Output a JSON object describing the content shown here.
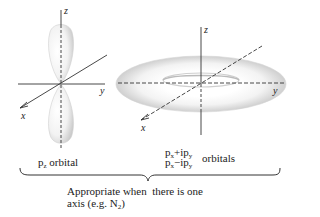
{
  "left_panel": {
    "axes": {
      "z": "z",
      "y": "y",
      "x": "x"
    },
    "label": {
      "main": "p",
      "sub": "z",
      "suffix": " orbital"
    }
  },
  "right_panel": {
    "axes": {
      "z": "z",
      "y": "y",
      "x": "x"
    },
    "label_line1": {
      "p1": "p",
      "s1": "x",
      "op": "+ip",
      "s2": "y"
    },
    "label_line2": {
      "p1": "p",
      "s1": "x",
      "op": "−ip",
      "s2": "y"
    },
    "label_suffix": "orbitals"
  },
  "caption": {
    "line1": "Appropriate when  there is one",
    "line2_main": "axis (e.g. N",
    "line2_sub": "2",
    "line2_end": ")"
  },
  "colors": {
    "line": "#333333",
    "shade": "#bdbdbd"
  }
}
